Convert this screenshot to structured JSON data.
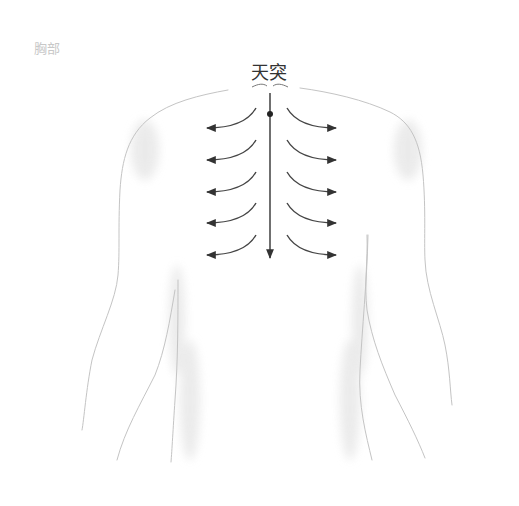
{
  "figure": {
    "corner_label": "胸部",
    "acupoint_label": "天突",
    "arrow_rows": 5,
    "colors": {
      "outline": "#c9c9c9",
      "shade": "#ececec",
      "arrow": "#444444",
      "label": "#333333",
      "corner_label": "#c8c8c8"
    }
  }
}
